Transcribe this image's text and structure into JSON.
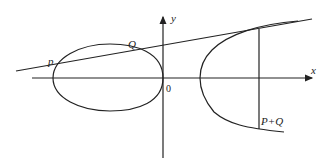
{
  "diagram": {
    "labels": {
      "x_axis": "x",
      "y_axis": "y",
      "origin": "0",
      "point_p": "p",
      "point_q": "Q",
      "point_sum": "P+Q"
    },
    "colors": {
      "line": "#222222",
      "background": "#ffffff"
    }
  }
}
